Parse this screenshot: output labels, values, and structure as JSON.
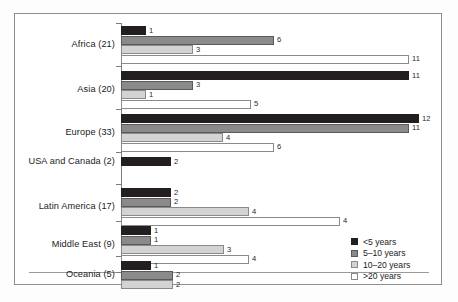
{
  "chart_data": {
    "type": "bar",
    "orientation": "horizontal",
    "title": "",
    "xlabel": "",
    "ylabel": "",
    "grid": false,
    "legend_position": "bottom-right",
    "xlim": [
      0,
      12
    ],
    "categories": [
      "Africa (21)",
      "Asia (20)",
      "Europe (33)",
      "USA and Canada (2)",
      "Latin America (17)",
      "Middle East (9)",
      "Oceania (5)"
    ],
    "series": [
      {
        "name": "<5 years",
        "color": "#231f20",
        "values": [
          1,
          11,
          12,
          2,
          2,
          1,
          1
        ]
      },
      {
        "name": "5–10 years",
        "color": "#8a8a8a",
        "values": [
          6,
          3,
          11,
          null,
          2,
          1,
          2
        ]
      },
      {
        "name": "10–20 years",
        "color": "#d3d3d3",
        "values": [
          3,
          1,
          4,
          null,
          4,
          3,
          2
        ]
      },
      {
        "name": ">20 years",
        "color": "#ffffff",
        "values": [
          11,
          5,
          6,
          null,
          4,
          4,
          null
        ]
      }
    ],
    "bars": [
      {
        "category": "Africa (21)",
        "series": "<5 years",
        "label": "1",
        "px_length": 25
      },
      {
        "category": "Africa (21)",
        "series": "5–10 years",
        "label": "6",
        "px_length": 153
      },
      {
        "category": "Africa (21)",
        "series": "10–20 years",
        "label": "3",
        "px_length": 72
      },
      {
        "category": "Africa (21)",
        "series": ">20 years",
        "label": "11",
        "px_length": 288
      },
      {
        "category": "Asia (20)",
        "series": "<5 years",
        "label": "11",
        "px_length": 288
      },
      {
        "category": "Asia (20)",
        "series": "5–10 years",
        "label": "3",
        "px_length": 72
      },
      {
        "category": "Asia (20)",
        "series": "10–20 years",
        "label": "1",
        "px_length": 25
      },
      {
        "category": "Asia (20)",
        "series": ">20 years",
        "label": "5",
        "px_length": 130
      },
      {
        "category": "Europe (33)",
        "series": "<5 years",
        "label": "12",
        "px_length": 298
      },
      {
        "category": "Europe (33)",
        "series": "5–10 years",
        "label": "11",
        "px_length": 288
      },
      {
        "category": "Europe (33)",
        "series": "10–20 years",
        "label": "4",
        "px_length": 102
      },
      {
        "category": "Europe (33)",
        "series": ">20 years",
        "label": "6",
        "px_length": 153
      },
      {
        "category": "USA and Canada (2)",
        "series": "<5 years",
        "label": "2",
        "px_length": 50
      },
      {
        "category": "Latin America (17)",
        "series": "<5 years",
        "label": "2",
        "px_length": 50
      },
      {
        "category": "Latin America (17)",
        "series": "5–10 years",
        "label": "2",
        "px_length": 50
      },
      {
        "category": "Latin America (17)",
        "series": "10–20 years",
        "label": "4",
        "px_length": 128
      },
      {
        "category": "Latin America (17)",
        "series": ">20 years",
        "label": "4",
        "px_length": 219
      },
      {
        "category": "Middle East (9)",
        "series": "<5 years",
        "label": "1",
        "px_length": 30
      },
      {
        "category": "Middle East (9)",
        "series": "5–10 years",
        "label": "1",
        "px_length": 30
      },
      {
        "category": "Middle East (9)",
        "series": "10–20 years",
        "label": "3",
        "px_length": 103
      },
      {
        "category": "Middle East (9)",
        "series": ">20 years",
        "label": "4",
        "px_length": 128
      },
      {
        "category": "Oceania (5)",
        "series": "<5 years",
        "label": "1",
        "px_length": 30
      },
      {
        "category": "Oceania (5)",
        "series": "5–10 years",
        "label": "2",
        "px_length": 52
      },
      {
        "category": "Oceania (5)",
        "series": "10–20 years",
        "label": "2",
        "px_length": 52
      }
    ],
    "legend": [
      {
        "label": "<5 years",
        "color": "#231f20"
      },
      {
        "label": "5–10 years",
        "color": "#8a8a8a"
      },
      {
        "label": "10–20 years",
        "color": "#d3d3d3"
      },
      {
        "label": ">20 years",
        "color": "#ffffff"
      }
    ]
  }
}
